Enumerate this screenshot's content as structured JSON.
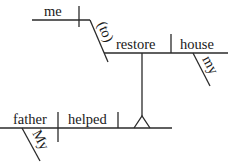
{
  "diagram": {
    "type": "sentence-diagram",
    "sentence_words": {
      "subject": "father",
      "subject_modifier": "My",
      "verb": "helped",
      "object": "me",
      "infinitive_marker": "(to)",
      "infinitive_verb": "restore",
      "infinitive_object": "house",
      "infinitive_object_modifier": "my"
    },
    "colors": {
      "line": "#2a2a2a",
      "text": "#1a1a1a",
      "background": "#ffffff"
    }
  }
}
